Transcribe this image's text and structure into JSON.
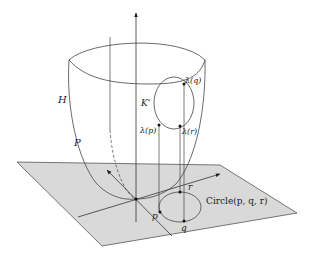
{
  "figure": {
    "colors": {
      "plane_fill": "#d9d9d9",
      "plane_edge": "#555555",
      "line": "#333333",
      "background": "#ffffff"
    },
    "labels": {
      "surface": "H",
      "paraboloid_point": "P",
      "lifted_curve": "K'",
      "lambda_q": "λ(q)",
      "lambda_p": "λ(p)",
      "lambda_r": "λ(r)",
      "point_p": "p",
      "point_q": "q",
      "point_r": "r",
      "circle": "Circle(p, q, r)"
    }
  }
}
